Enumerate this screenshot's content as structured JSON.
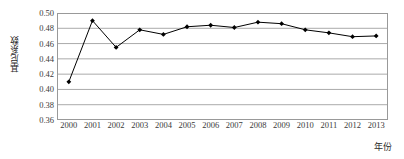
{
  "chart_data": {
    "type": "line",
    "title": "",
    "xlabel": "年份",
    "ylabel": "基尼系数",
    "categories": [
      "2000",
      "2001",
      "2002",
      "2003",
      "2004",
      "2005",
      "2006",
      "2007",
      "2008",
      "2009",
      "2010",
      "2011",
      "2012",
      "2013"
    ],
    "values": [
      0.41,
      0.49,
      0.455,
      0.478,
      0.472,
      0.482,
      0.484,
      0.481,
      0.488,
      0.486,
      0.478,
      0.474,
      0.469,
      0.47
    ],
    "series": [
      {
        "name": "基尼系数",
        "values": [
          0.41,
          0.49,
          0.455,
          0.478,
          0.472,
          0.482,
          0.484,
          0.481,
          0.488,
          0.486,
          0.478,
          0.474,
          0.469,
          0.47
        ]
      }
    ],
    "ylim": [
      0.36,
      0.5
    ],
    "yticks": [
      0.36,
      0.38,
      0.4,
      0.42,
      0.44,
      0.46,
      0.48,
      0.5
    ],
    "ytick_labels": [
      "0.36",
      "0.38",
      "0.40",
      "0.42",
      "0.44",
      "0.46",
      "0.48",
      "0.50"
    ],
    "grid": "horizontal",
    "legend": "none",
    "line_color": "#000000",
    "marker": "diamond",
    "marker_color": "#000000",
    "gridline_color": "#aaaaaa",
    "background": "#ffffff"
  }
}
